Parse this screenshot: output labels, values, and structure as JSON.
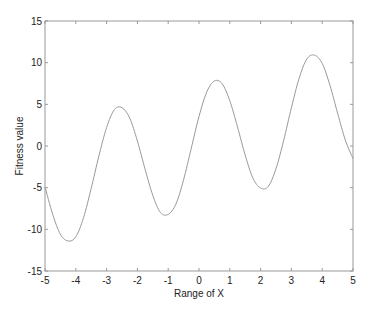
{
  "chart_data": {
    "type": "line",
    "title": "",
    "xlabel": "Range of X",
    "ylabel": "Fitness value",
    "xlim": [
      -5,
      5
    ],
    "ylim": [
      -15,
      15
    ],
    "xticks": [
      -5,
      -4,
      -3,
      -2,
      -1,
      0,
      1,
      2,
      3,
      4,
      5
    ],
    "yticks": [
      -15,
      -10,
      -5,
      0,
      5,
      10,
      15
    ],
    "grid": false,
    "legend": null,
    "series": [
      {
        "name": "fitness",
        "color": "#999999",
        "x": [
          -5,
          -4.75,
          -4.5,
          -4.25,
          -4,
          -3.75,
          -3.5,
          -3.25,
          -3,
          -2.75,
          -2.5,
          -2.25,
          -2,
          -1.75,
          -1.5,
          -1.25,
          -1,
          -0.75,
          -0.5,
          -0.25,
          0,
          0.25,
          0.5,
          0.75,
          1,
          1.25,
          1.5,
          1.75,
          2,
          2.25,
          2.5,
          2.75,
          3,
          3.25,
          3.5,
          3.75,
          4,
          4.25,
          4.5,
          4.75,
          5
        ],
        "y": [
          -4.9,
          -8.2,
          -10.6,
          -11.4,
          -10.9,
          -8.61,
          -5.09,
          -1.19,
          2.22,
          4.35,
          4.6,
          3.35,
          0.6,
          -2.79,
          -5.93,
          -7.98,
          -8.2,
          -6.97,
          -4.04,
          -0.25,
          3.54,
          6.47,
          7.8,
          7.48,
          5.43,
          2.29,
          -1.1,
          -3.85,
          -5.04,
          -4.85,
          -2.72,
          0.69,
          4.59,
          8.11,
          10.44,
          10.9,
          9.91,
          7.3,
          3.94,
          0.72,
          -1.51
        ]
      }
    ],
    "extrema": {
      "peaks": [
        [
          -2.63,
          4.68
        ],
        [
          0.55,
          7.8
        ],
        [
          3.64,
          10.9
        ]
      ],
      "troughs": [
        [
          -4.25,
          -11.3
        ],
        [
          -1.1,
          -8.17
        ],
        [
          2.05,
          -5.04
        ]
      ]
    }
  },
  "labels": {
    "xlabel": "Range of X",
    "ylabel": "Fitness value"
  }
}
